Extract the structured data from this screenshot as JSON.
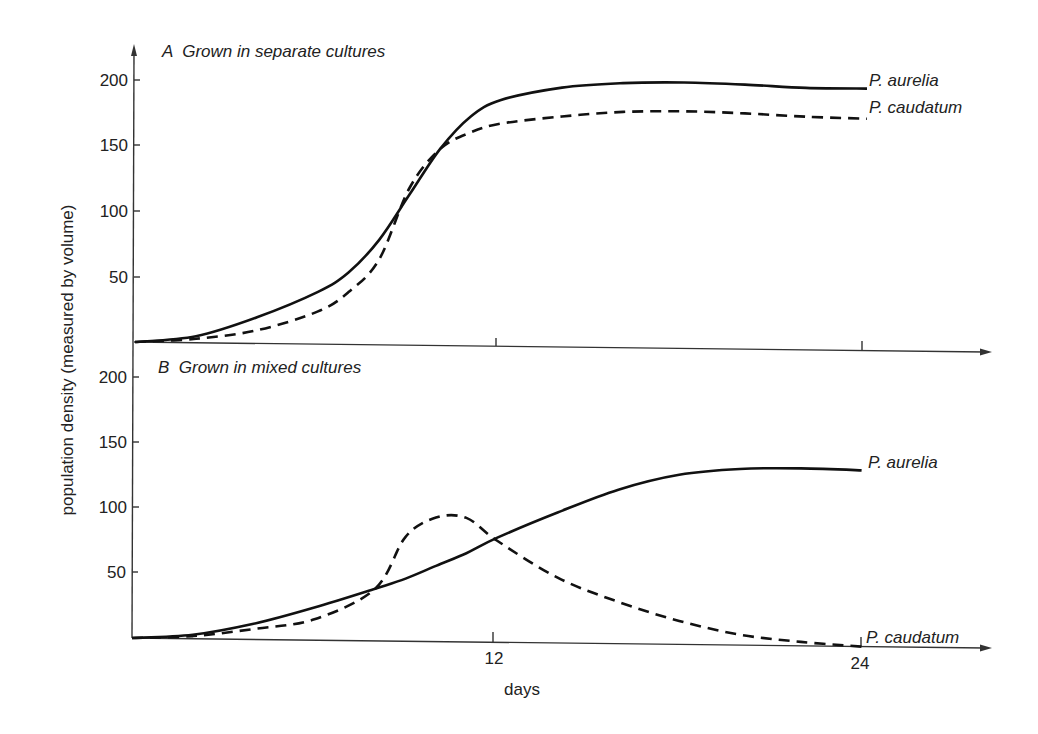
{
  "chart_data": {
    "type": "line",
    "ylabel": "population density (measured by volume)",
    "xlabel": "days",
    "x_ticks": [
      12,
      24
    ],
    "y_ticks": [
      50,
      100,
      150,
      200
    ],
    "panels": [
      {
        "id": "A",
        "title": "A  Grown in separate cultures",
        "xlim": [
          0,
          27
        ],
        "ylim": [
          0,
          220
        ],
        "x": [
          0,
          2,
          4,
          6,
          7,
          8,
          9,
          10,
          11,
          12,
          14,
          16,
          18,
          20,
          22,
          24
        ],
        "series": [
          {
            "name": "P. aurelia",
            "style": "solid",
            "values": [
              0,
              5,
              20,
              40,
              55,
              80,
              115,
              150,
              175,
              188,
              198,
              202,
              203,
              202,
              200,
              200
            ]
          },
          {
            "name": "P. caudatum",
            "style": "dashed",
            "values": [
              0,
              3,
              10,
              25,
              40,
              65,
              120,
              150,
              163,
              170,
              176,
              180,
              181,
              180,
              178,
              177
            ]
          }
        ]
      },
      {
        "id": "B",
        "title": "B  Grown in mixed cultures",
        "xlim": [
          0,
          27
        ],
        "ylim": [
          0,
          220
        ],
        "x": [
          0,
          2,
          4,
          6,
          8,
          9,
          10,
          11,
          12,
          14,
          16,
          18,
          20,
          22,
          24
        ],
        "series": [
          {
            "name": "P. aurelia",
            "style": "solid",
            "values": [
              0,
              3,
              12,
              25,
              40,
              48,
              58,
              68,
              80,
              100,
              118,
              130,
              135,
              136,
              135
            ]
          },
          {
            "name": "P. caudatum",
            "style": "dashed",
            "values": [
              0,
              2,
              8,
              16,
              40,
              80,
              95,
              95,
              78,
              50,
              32,
              18,
              8,
              3,
              0
            ]
          }
        ]
      }
    ]
  },
  "labels": {
    "ylabel": "population density (measured by volume)",
    "xlabel": "days",
    "panel_a_title": "A  Grown in separate cultures",
    "panel_b_title": "B  Grown in mixed cultures",
    "a_aurelia": "P. aurelia",
    "a_caudatum": "P. caudatum",
    "b_aurelia": "P. aurelia",
    "b_caudatum": "P. caudatum",
    "y200": "200",
    "y150": "150",
    "y100": "100",
    "y50": "50",
    "x12": "12",
    "x24": "24"
  }
}
